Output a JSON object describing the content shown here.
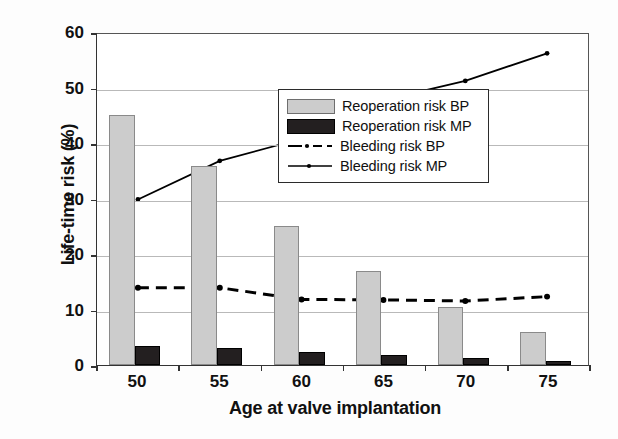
{
  "chart_data": {
    "type": "bar",
    "title": "",
    "xlabel": "Age at valve implantation",
    "ylabel": "Life-time risk (%)",
    "categories": [
      "50",
      "55",
      "60",
      "65",
      "70",
      "75"
    ],
    "ylim": [
      0,
      60
    ],
    "yticks": [
      "0",
      "10",
      "20",
      "30",
      "40",
      "50",
      "60"
    ],
    "grid": true,
    "legend_position": "inside-right",
    "series": [
      {
        "name": "Reoperation risk BP",
        "kind": "bar",
        "color": "#cccccc",
        "values": [
          45,
          35.8,
          25,
          17,
          10.5,
          6
        ]
      },
      {
        "name": "Reoperation risk MP",
        "kind": "bar",
        "color": "#231f20",
        "values": [
          3.5,
          3,
          2.4,
          1.8,
          1.3,
          0.8
        ]
      },
      {
        "name": "Bleeding risk BP",
        "kind": "line-dashed",
        "color": "#000000",
        "values": [
          14,
          14,
          11.9,
          11.8,
          11.6,
          12.4
        ]
      },
      {
        "name": "Bleeding risk MP",
        "kind": "line-solid",
        "color": "#000000",
        "values": [
          30,
          37,
          41,
          48,
          51.5,
          56.5
        ]
      }
    ]
  },
  "legend": {
    "items": [
      {
        "label": "Reoperation risk BP",
        "key": "swatch-bp"
      },
      {
        "label": "Reoperation risk MP",
        "key": "swatch-mp"
      },
      {
        "label": "Bleeding risk BP",
        "key": "line-dashed"
      },
      {
        "label": "Bleeding risk MP",
        "key": "line-solid"
      }
    ]
  }
}
